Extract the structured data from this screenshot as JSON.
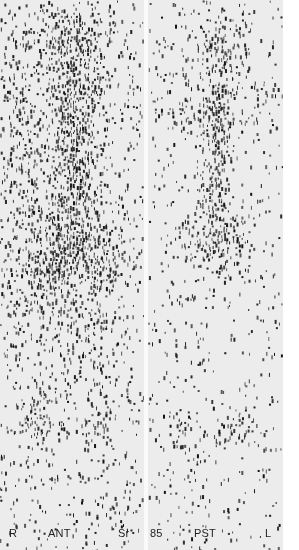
{
  "image": {
    "description": "Strontium-85 bone scintigram, anterior and posterior views of lower spine and pelvis",
    "panels": [
      {
        "id": "ant",
        "view_label": "ANT",
        "side_label_left": "R",
        "isotope_label": "Sr",
        "x": 0,
        "width": 144,
        "background_density": 0.1,
        "hotspots": [
          {
            "cx": 70,
            "cy": 40,
            "rx": 30,
            "ry": 40,
            "w": 0.55
          },
          {
            "cx": 72,
            "cy": 110,
            "rx": 22,
            "ry": 45,
            "w": 0.55
          },
          {
            "cx": 70,
            "cy": 175,
            "rx": 25,
            "ry": 40,
            "w": 0.45
          },
          {
            "cx": 72,
            "cy": 235,
            "rx": 30,
            "ry": 35,
            "w": 0.6
          },
          {
            "cx": 45,
            "cy": 270,
            "rx": 25,
            "ry": 30,
            "w": 0.5
          },
          {
            "cx": 100,
            "cy": 270,
            "rx": 22,
            "ry": 28,
            "w": 0.45
          },
          {
            "cx": 20,
            "cy": 150,
            "rx": 18,
            "ry": 120,
            "w": 0.25
          },
          {
            "cx": 40,
            "cy": 420,
            "rx": 14,
            "ry": 20,
            "w": 0.5
          },
          {
            "cx": 98,
            "cy": 420,
            "rx": 12,
            "ry": 18,
            "w": 0.4
          },
          {
            "cx": 70,
            "cy": 340,
            "rx": 45,
            "ry": 40,
            "w": 0.2
          }
        ]
      },
      {
        "id": "pst",
        "view_label": "PST",
        "side_label_right": "L",
        "isotope_label": "85",
        "x": 148,
        "width": 135,
        "background_density": 0.06,
        "hotspots": [
          {
            "cx": 70,
            "cy": 45,
            "rx": 25,
            "ry": 40,
            "w": 0.35
          },
          {
            "cx": 68,
            "cy": 115,
            "rx": 14,
            "ry": 30,
            "w": 0.7
          },
          {
            "cx": 64,
            "cy": 180,
            "rx": 12,
            "ry": 35,
            "w": 0.65
          },
          {
            "cx": 62,
            "cy": 240,
            "rx": 30,
            "ry": 30,
            "w": 0.5
          },
          {
            "cx": 40,
            "cy": 110,
            "rx": 25,
            "ry": 25,
            "w": 0.2
          },
          {
            "cx": 110,
            "cy": 100,
            "rx": 18,
            "ry": 25,
            "w": 0.2
          },
          {
            "cx": 30,
            "cy": 425,
            "rx": 14,
            "ry": 18,
            "w": 0.35
          },
          {
            "cx": 85,
            "cy": 425,
            "rx": 14,
            "ry": 18,
            "w": 0.35
          },
          {
            "cx": 40,
            "cy": 470,
            "rx": 8,
            "ry": 12,
            "w": 0.2
          }
        ]
      }
    ]
  },
  "labels": {
    "r": "R",
    "ant": "ANT",
    "sr": "Sr",
    "n85": "85",
    "pst": "PST",
    "l": "L"
  },
  "colors": {
    "dot": "#111111",
    "panel_bg": "#ececec",
    "page_bg": "#ffffff"
  }
}
